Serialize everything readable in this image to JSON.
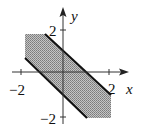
{
  "figure": {
    "type": "region-plot",
    "axes": {
      "x_label": "x",
      "y_label": "y",
      "x_ticks": [
        {
          "value": -2,
          "label": "−2"
        },
        {
          "value": 2,
          "label": "2"
        }
      ],
      "y_ticks": [
        {
          "value": 2,
          "label": "2"
        },
        {
          "value": -2,
          "label": "−2"
        }
      ]
    },
    "boundary_lines": [
      {
        "equation": "x + y = 1",
        "style": "solid-bold"
      },
      {
        "equation": "x + y = -1",
        "style": "solid-bold"
      }
    ],
    "bounding_square": {
      "xmin": -2,
      "xmax": 2,
      "ymin": -2,
      "ymax": 2
    },
    "colors": {
      "shade": "#a8a8a8",
      "line": "#111111",
      "axis": "#333333"
    }
  }
}
